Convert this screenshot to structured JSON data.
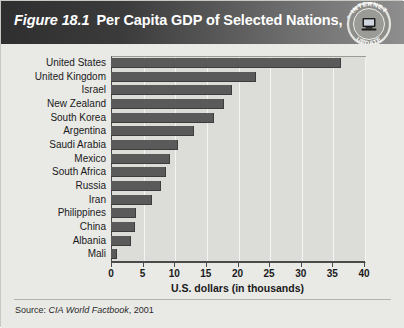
{
  "figure": {
    "number": "Figure 18.1",
    "title": "Per Capita GDP of Selected Nations, 2000",
    "source_prefix": "Source:",
    "source_italic": "CIA World Factbook",
    "source_suffix": ", 2001"
  },
  "seal": {
    "top_text": "INTERNET",
    "bottom_text": "UPDATE",
    "icon": "computer-icon"
  },
  "colors": {
    "title_bar_dark": "#2f2f2f",
    "title_bar_light": "#8e8e8e",
    "bar_fill": "#5a5a5a",
    "plot_background": "#dcdcd8",
    "panel_background": "#e9e9e6",
    "gridline": "#f4f4f2",
    "axis": "#4a4a4a"
  },
  "chart_data": {
    "type": "bar",
    "orientation": "horizontal",
    "title": "Per Capita GDP of Selected Nations, 2000",
    "xlabel": "U.S. dollars (in thousands)",
    "ylabel": "",
    "xlim": [
      0,
      40
    ],
    "xticks": [
      0,
      5,
      10,
      15,
      20,
      25,
      30,
      35,
      40
    ],
    "xtick_labels": [
      "0",
      "5",
      "10",
      "15",
      "20",
      "25",
      "30",
      "35",
      "40"
    ],
    "grid": true,
    "legend": "none",
    "categories": [
      "United States",
      "United Kingdom",
      "Israel",
      "New Zealand",
      "South Korea",
      "Argentina",
      "Saudi Arabia",
      "Mexico",
      "South Africa",
      "Russia",
      "Iran",
      "Philippines",
      "China",
      "Albania",
      "Mali"
    ],
    "values": [
      36.2,
      22.8,
      18.9,
      17.7,
      16.1,
      12.9,
      10.5,
      9.1,
      8.5,
      7.7,
      6.3,
      3.8,
      3.6,
      3.0,
      0.8
    ],
    "units": "thousands of U.S. dollars",
    "source": "CIA World Factbook, 2001"
  }
}
